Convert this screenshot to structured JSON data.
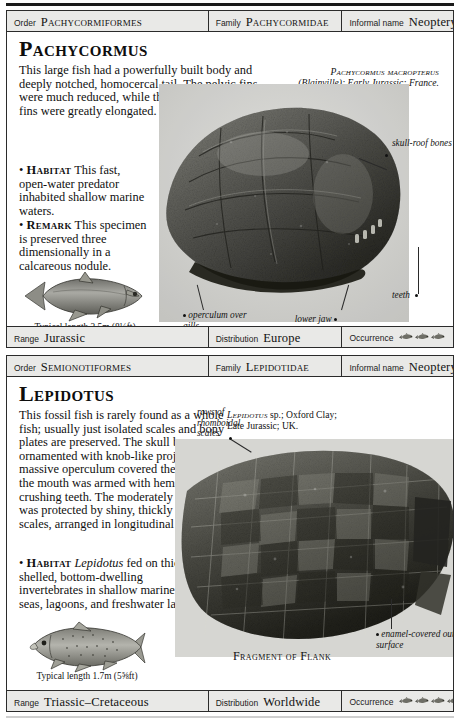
{
  "page": {
    "entries": [
      {
        "header": {
          "order_label": "Order",
          "order_value": "Pachycormiformes",
          "family_label": "Family",
          "family_value": "Pachycormidae",
          "informal_label": "Informal name",
          "informal_value": "Neopterygian"
        },
        "title": "Pachycormus",
        "description": {
          "wide": "This large fish had a powerfully built body and deeply notched, homocercal tail. The pelvic fins were much reduced, while the scythe-like pectoral fins were greatly elongated.",
          "habitat_marker": "• ",
          "habitat_label": "Habitat",
          "habitat_text": " This fast, open-water predator inhabited shallow marine waters.",
          "remark_marker": "• ",
          "remark_label": "Remark",
          "remark_text": " This specimen is preserved three dimensionally in a calcareous nodule."
        },
        "credit": {
          "genus": "Pachycormus macropterus",
          "rest": "(Blainville); Early Jurassic; France."
        },
        "callouts": [
          {
            "name": "skull-roof-bones",
            "text": "skull-roof bones"
          },
          {
            "name": "teeth",
            "text": "teeth"
          },
          {
            "name": "operculum-over-gills",
            "text": "operculum over gills"
          },
          {
            "name": "lower-jaw",
            "text": "lower jaw"
          }
        ],
        "reconstruction_caption": "Typical length 2.5m (8¼ft)",
        "footer": {
          "range_label": "Range",
          "range_value": "Jurassic",
          "distribution_label": "Distribution",
          "distribution_value": "Europe",
          "occurrence_label": "Occurrence",
          "occurrence_count": 3
        }
      },
      {
        "header": {
          "order_label": "Order",
          "order_value": "Semionotiformes",
          "family_label": "Family",
          "family_value": "Lepidotidae",
          "informal_label": "Informal name",
          "informal_value": "Neopterygian"
        },
        "title": "Lepidotus",
        "description": {
          "wide": "This fossil fish is rarely found as a whole fish; usually just isolated scales and bony plates are preserved. The skull bones were ornamented with knob-like projections, a massive operculum covered the gills, and the mouth was armed with hemispherical, crushing teeth. The moderately deep body was protected by shiny, thickly enamelled scales, arranged in longitudinal rows.",
          "habitat_marker": "• ",
          "habitat_label": "Habitat",
          "habitat_genus": "Lepidotus",
          "habitat_text": " fed on thick-shelled, bottom-dwelling invertebrates in shallow marine seas, lagoons, and freshwater lakes."
        },
        "credit": {
          "genus": "Lepidotus",
          "rest": " sp.; Oxford Clay; Late Jurassic; UK."
        },
        "callouts": [
          {
            "name": "rows-of-rhomboidal-scales",
            "text": "rows of rhomboidal scales"
          },
          {
            "name": "enamel-covered-outer-surface",
            "text": "enamel-covered outer surface"
          }
        ],
        "figure_caption": "Fragment of Flank",
        "reconstruction_caption": "Typical length 1.7m (5⅝ft)",
        "footer": {
          "range_label": "Range",
          "range_value": "Triassic–Cretaceous",
          "distribution_label": "Distribution",
          "distribution_value": "Worldwide",
          "occurrence_label": "Occurrence",
          "occurrence_count": 4
        }
      }
    ]
  },
  "colors": {
    "bar_fill": "#e9e9e7",
    "rule": "#2b2b2b",
    "text": "#111111"
  }
}
